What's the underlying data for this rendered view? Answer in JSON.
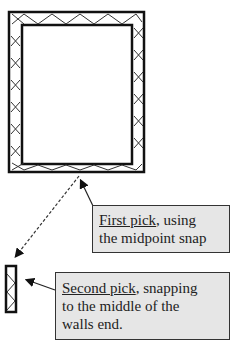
{
  "diagram": {
    "type": "cad-wall-snap-illustration",
    "main_wall": {
      "outer": {
        "x": 8,
        "y": 11,
        "w": 137,
        "h": 162
      },
      "inner": {
        "x": 21,
        "y": 24,
        "w": 112,
        "h": 141
      },
      "hatch": "cross-x"
    },
    "small_wall": {
      "x": 5,
      "y": 265,
      "w": 11,
      "h": 47
    },
    "dashed_line": {
      "from": [
        79,
        176
      ],
      "to": [
        14,
        258
      ]
    },
    "colors": {
      "line": "#222222",
      "callout_bg": "#e6e6e6",
      "callout_border": "#333333"
    }
  },
  "callouts": [
    {
      "emph": "First pick",
      "rest_line1": ", using",
      "line2": "the midpoint snap"
    },
    {
      "emph": "Second pick",
      "rest_line1": ", snapping",
      "line2": "to the middle of the",
      "line3": "walls end."
    }
  ]
}
